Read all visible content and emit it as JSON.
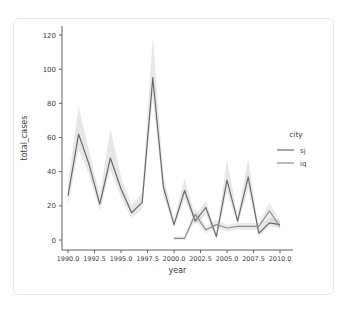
{
  "window": {
    "background": "#ffffff",
    "card_border_color": "#e9e6e2"
  },
  "chart_data": {
    "type": "line",
    "title": "",
    "xlabel": "year",
    "ylabel": "total_cases",
    "x_tick_labels": [
      "1990.0",
      "1992.5",
      "1995.0",
      "1997.5",
      "2000.0",
      "2002.5",
      "2005.0",
      "2007.5",
      "2010.0"
    ],
    "x_ticks": [
      1990.0,
      1992.5,
      1995.0,
      1997.5,
      2000.0,
      2002.5,
      2005.0,
      2007.5,
      2010.0
    ],
    "y_ticks": [
      0,
      20,
      40,
      60,
      80,
      100,
      120
    ],
    "xlim": [
      1989.4,
      2011.2
    ],
    "ylim": [
      -6,
      125
    ],
    "grid": false,
    "axis_color": "#5f5f5f",
    "legend": {
      "title": "city",
      "position": "right",
      "entries": [
        {
          "label": "sj",
          "color": "#6a6a6a"
        },
        {
          "label": "iq",
          "color": "#8f8f8f"
        }
      ]
    },
    "series": [
      {
        "name": "sj",
        "color": "#6a6a6a",
        "band_color": "#b9b9b9",
        "x": [
          1990,
          1991,
          1992,
          1993,
          1994,
          1995,
          1996,
          1997,
          1998,
          1999,
          2000,
          2001,
          2002,
          2003,
          2004,
          2005,
          2006,
          2007,
          2008,
          2009,
          2010
        ],
        "y": [
          26,
          62,
          44,
          21,
          48,
          30,
          16,
          22,
          95,
          31,
          9,
          29,
          11,
          19,
          2,
          35,
          11,
          37,
          4,
          10,
          9
        ],
        "band_lo": [
          20,
          53,
          38,
          17,
          41,
          25,
          13,
          18,
          83,
          26,
          7,
          24,
          9,
          15,
          1,
          28,
          9,
          30,
          2,
          8,
          7
        ],
        "band_hi": [
          33,
          78,
          52,
          26,
          65,
          37,
          20,
          28,
          119,
          38,
          12,
          36,
          14,
          23,
          4,
          47,
          14,
          48,
          6,
          13,
          12
        ]
      },
      {
        "name": "iq",
        "color": "#8f8f8f",
        "band_color": "#c6c6c6",
        "x": [
          2000,
          2001,
          2002,
          2003,
          2004,
          2005,
          2006,
          2007,
          2008,
          2009,
          2010
        ],
        "y": [
          1,
          1,
          15,
          6,
          9,
          7,
          8,
          8,
          8,
          17,
          8
        ],
        "band_lo": [
          0,
          0,
          11,
          4,
          7,
          5,
          6,
          6,
          6,
          12,
          6
        ],
        "band_hi": [
          2,
          2,
          19,
          8,
          12,
          9,
          10,
          10,
          10,
          22,
          11
        ]
      }
    ]
  }
}
